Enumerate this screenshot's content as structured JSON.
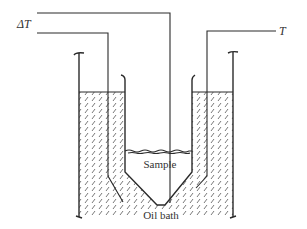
{
  "diagram": {
    "type": "apparatus schematic",
    "labels": {
      "delta_t": "ΔT",
      "t": "T",
      "sample": "Sample",
      "oil_bath": "Oil bath"
    },
    "components": [
      "outer oil bath vessel",
      "inner sample tube (conical bottom)",
      "sample thermocouple lead",
      "reference / differential thermocouple lead (ΔT)",
      "bath temperature thermocouple lead (T)",
      "oil (hatched)",
      "sample liquid surface"
    ],
    "colors": {
      "ink": "#2a2a2a",
      "background": "#ffffff"
    }
  }
}
